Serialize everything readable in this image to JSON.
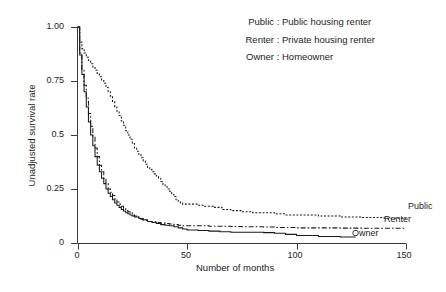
{
  "chart_data": {
    "type": "line",
    "title": "",
    "subtitle": "",
    "xlabel": "Number of months",
    "ylabel": "Unadjusted survival rate",
    "xlim": [
      0,
      150
    ],
    "ylim": [
      0,
      1.0
    ],
    "grid": false,
    "legend_position": "top-right",
    "xticks": [
      0,
      50,
      100,
      150
    ],
    "xtick_labels": [
      "0",
      "50",
      "100",
      "150"
    ],
    "yticks": [
      0,
      0.25,
      0.5,
      0.75,
      1.0
    ],
    "ytick_labels": [
      "0",
      "0.25",
      "0.5",
      "0.75",
      "1.00"
    ],
    "annotations": [
      {
        "text": "Public",
        "x": 150,
        "y": 0.115
      },
      {
        "text": "Renter",
        "x": 150,
        "y": 0.068
      },
      {
        "text": "Owner",
        "x": 127,
        "y": 0.028
      }
    ],
    "series": [
      {
        "name": "Public",
        "linestyle": "dotted",
        "color": "#1a1a1a",
        "end_label": "Public",
        "x": [
          0,
          1,
          2,
          3,
          4,
          5,
          6,
          7,
          8,
          9,
          10,
          11,
          12,
          13,
          14,
          15,
          16,
          17,
          18,
          19,
          20,
          21,
          22,
          23,
          24,
          25,
          26,
          27,
          28,
          29,
          30,
          31,
          32,
          33,
          34,
          35,
          36,
          37,
          38,
          39,
          40,
          41,
          42,
          43,
          44,
          45,
          46,
          47,
          48,
          50,
          52,
          55,
          58,
          62,
          66,
          70,
          75,
          80,
          85,
          90,
          95,
          100,
          110,
          120,
          130,
          140,
          150
        ],
        "y": [
          1.0,
          0.93,
          0.9,
          0.88,
          0.86,
          0.845,
          0.83,
          0.815,
          0.8,
          0.785,
          0.77,
          0.755,
          0.74,
          0.72,
          0.7,
          0.68,
          0.655,
          0.63,
          0.61,
          0.59,
          0.565,
          0.545,
          0.52,
          0.5,
          0.48,
          0.46,
          0.44,
          0.425,
          0.41,
          0.395,
          0.38,
          0.365,
          0.35,
          0.34,
          0.33,
          0.32,
          0.31,
          0.3,
          0.285,
          0.27,
          0.26,
          0.25,
          0.24,
          0.225,
          0.215,
          0.2,
          0.19,
          0.185,
          0.18,
          0.18,
          0.18,
          0.175,
          0.17,
          0.165,
          0.155,
          0.15,
          0.145,
          0.14,
          0.14,
          0.135,
          0.13,
          0.13,
          0.125,
          0.12,
          0.118,
          0.115,
          0.115
        ]
      },
      {
        "name": "Renter",
        "linestyle": "dashdot",
        "color": "#1a1a1a",
        "end_label": "Renter",
        "x": [
          0,
          1,
          2,
          3,
          4,
          5,
          6,
          7,
          8,
          9,
          10,
          11,
          12,
          13,
          14,
          15,
          16,
          17,
          18,
          19,
          20,
          21,
          22,
          23,
          24,
          25,
          26,
          27,
          28,
          29,
          30,
          32,
          34,
          36,
          38,
          40,
          42,
          44,
          46,
          48,
          50,
          55,
          60,
          65,
          70,
          75,
          80,
          85,
          90,
          100,
          110,
          120,
          130,
          140,
          150
        ],
        "y": [
          1.0,
          0.88,
          0.8,
          0.73,
          0.67,
          0.6,
          0.54,
          0.49,
          0.44,
          0.4,
          0.36,
          0.33,
          0.3,
          0.275,
          0.25,
          0.235,
          0.22,
          0.205,
          0.19,
          0.18,
          0.17,
          0.16,
          0.15,
          0.145,
          0.14,
          0.13,
          0.125,
          0.12,
          0.115,
          0.11,
          0.105,
          0.1,
          0.098,
          0.095,
          0.092,
          0.09,
          0.088,
          0.085,
          0.082,
          0.08,
          0.08,
          0.08,
          0.078,
          0.078,
          0.076,
          0.075,
          0.075,
          0.074,
          0.072,
          0.07,
          0.07,
          0.069,
          0.068,
          0.068,
          0.068
        ]
      },
      {
        "name": "Owner",
        "linestyle": "solid",
        "color": "#1a1a1a",
        "end_label": "Owner",
        "x": [
          0,
          1,
          2,
          3,
          4,
          5,
          6,
          7,
          8,
          9,
          10,
          11,
          12,
          13,
          14,
          15,
          16,
          17,
          18,
          19,
          20,
          21,
          22,
          23,
          24,
          25,
          26,
          28,
          30,
          32,
          34,
          36,
          38,
          40,
          42,
          44,
          46,
          48,
          50,
          55,
          60,
          65,
          70,
          75,
          80,
          85,
          90,
          95,
          100,
          110,
          120,
          127
        ],
        "y": [
          1.0,
          0.87,
          0.78,
          0.7,
          0.63,
          0.56,
          0.5,
          0.45,
          0.4,
          0.36,
          0.33,
          0.3,
          0.275,
          0.25,
          0.23,
          0.215,
          0.2,
          0.185,
          0.175,
          0.165,
          0.155,
          0.148,
          0.14,
          0.135,
          0.13,
          0.125,
          0.12,
          0.113,
          0.108,
          0.1,
          0.095,
          0.09,
          0.085,
          0.082,
          0.08,
          0.075,
          0.07,
          0.065,
          0.06,
          0.058,
          0.055,
          0.052,
          0.05,
          0.05,
          0.05,
          0.048,
          0.045,
          0.04,
          0.035,
          0.03,
          0.028,
          0.028
        ]
      }
    ]
  },
  "legend": {
    "rows": [
      {
        "key": "Public",
        "colon": ":",
        "description": "Public housing renter"
      },
      {
        "key": "Renter",
        "colon": ":",
        "description": "Private housing renter"
      },
      {
        "key": "Owner",
        "colon": ":",
        "description": "Homeowner"
      }
    ]
  },
  "axes": {
    "x_title": "Number of months",
    "y_title": "Unadjusted survival rate",
    "x_tick_labels": [
      "0",
      "50",
      "100",
      "150"
    ],
    "y_tick_labels": [
      "1.00",
      "0.75",
      "0.5",
      "0.25",
      "0"
    ]
  },
  "curve_labels": {
    "public": "Public",
    "renter": "Renter",
    "owner": "Owner"
  },
  "colors": {
    "background": "#ffffff",
    "ink": "#1a1a1a",
    "axis": "#3a3a3a"
  }
}
